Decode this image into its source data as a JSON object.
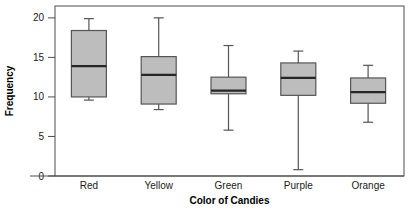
{
  "chart_data": {
    "type": "box",
    "title": "",
    "xlabel": "Color of Candies",
    "ylabel": "Frequency",
    "categories": [
      "Red",
      "Yellow",
      "Green",
      "Purple",
      "Orange"
    ],
    "ylim": [
      0,
      21.5
    ],
    "yticks": [
      0,
      5,
      10,
      15,
      20
    ],
    "ytick_labels": [
      "0",
      "5",
      "10",
      "15",
      "20"
    ],
    "grid": false,
    "legend": false,
    "box_fill_color": "#bdbdbd",
    "box_edge_color": "#555555",
    "median_color": "#262626",
    "boxes": [
      {
        "category": "Red",
        "whisker_low": 9.6,
        "q1": 10.0,
        "median": 13.9,
        "q3": 18.4,
        "whisker_high": 19.9
      },
      {
        "category": "Yellow",
        "whisker_low": 8.4,
        "q1": 9.1,
        "median": 12.8,
        "q3": 15.1,
        "whisker_high": 20.0
      },
      {
        "category": "Green",
        "whisker_low": 5.8,
        "q1": 10.4,
        "median": 10.8,
        "q3": 12.5,
        "whisker_high": 16.5
      },
      {
        "category": "Purple",
        "whisker_low": 0.8,
        "q1": 10.2,
        "median": 12.4,
        "q3": 14.3,
        "whisker_high": 15.8
      },
      {
        "category": "Orange",
        "whisker_low": 6.8,
        "q1": 9.2,
        "median": 10.6,
        "q3": 12.4,
        "whisker_high": 14.0
      }
    ]
  }
}
